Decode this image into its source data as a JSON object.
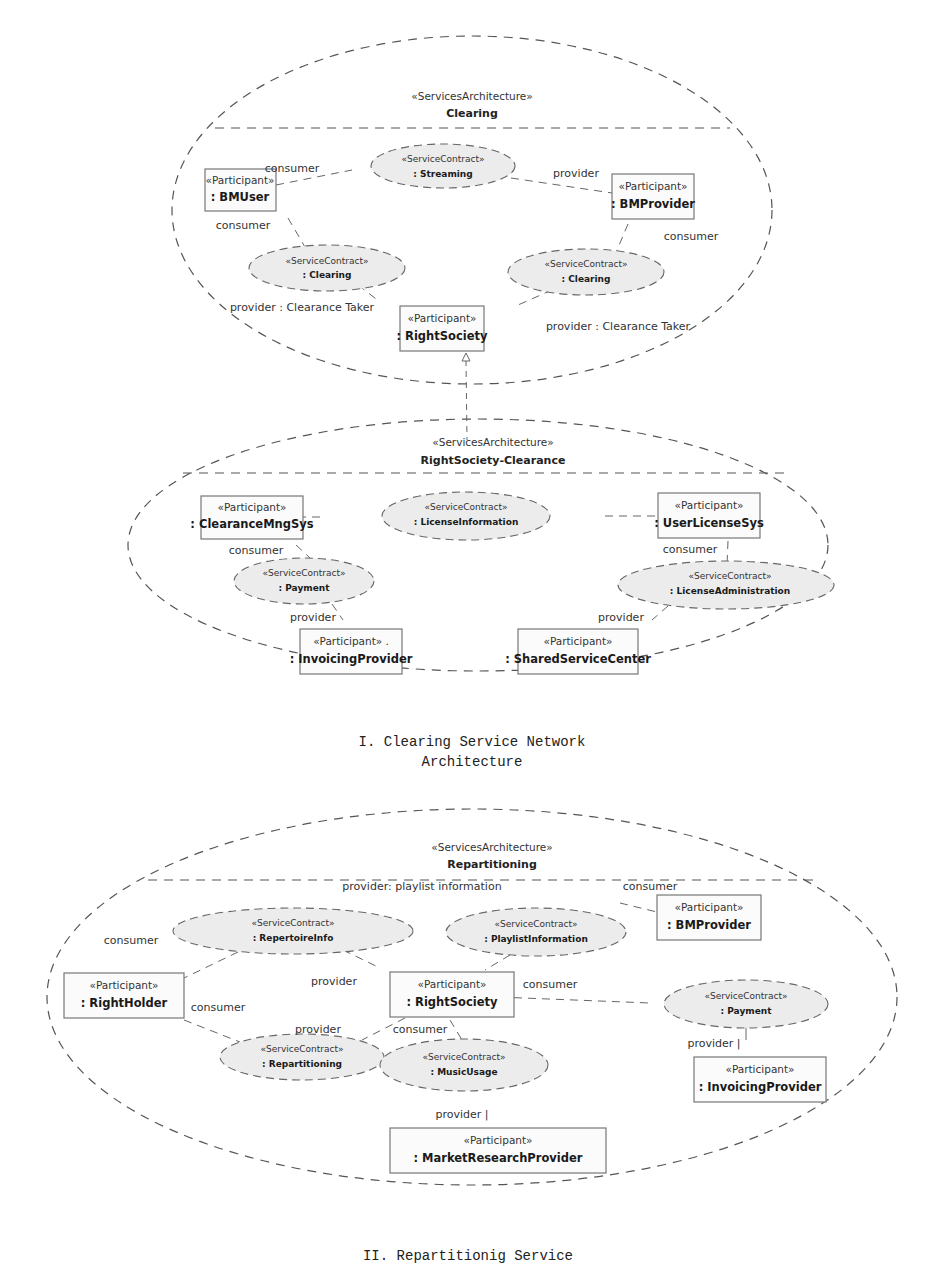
{
  "diagrams": [
    {
      "stereotype": "«ServicesArchitecture»",
      "name": "Clearing",
      "participants": [
        {
          "stereotype": "«Participant»",
          "name": ": BMUser"
        },
        {
          "stereotype": "«Participant»",
          "name": ": BMProvider"
        },
        {
          "stereotype": "«Participant»",
          "name": ": RightSociety"
        }
      ],
      "contracts": [
        {
          "stereotype": "«ServiceContract»",
          "name": ": Streaming"
        },
        {
          "stereotype": "«ServiceContract»",
          "name": ": Clearing"
        },
        {
          "stereotype": "«ServiceContract»",
          "name": ": Clearing"
        }
      ],
      "roles": [
        "consumer",
        "provider",
        "consumer",
        "consumer",
        "provider : Clearance Taker",
        "provider : Clearance Taker"
      ]
    },
    {
      "stereotype": "«ServicesArchitecture»",
      "name": "RightSociety-Clearance",
      "participants": [
        {
          "stereotype": "«Participant»",
          "name": ": ClearanceMngSys"
        },
        {
          "stereotype": "«Participant»",
          "name": ": UserLicenseSys"
        },
        {
          "stereotype": "«Participant» .",
          "name": ": InvoicingProvider"
        },
        {
          "stereotype": "«Participant»",
          "name": ": SharedServiceCenter"
        }
      ],
      "contracts": [
        {
          "stereotype": "«ServiceContract»",
          "name": ": LicenseInformation"
        },
        {
          "stereotype": "«ServiceContract»",
          "name": ": Payment"
        },
        {
          "stereotype": "«ServiceContract»",
          "name": ": LicenseAdministration"
        }
      ],
      "roles": [
        "consumer",
        "provider",
        "consumer",
        "provider"
      ]
    },
    {
      "stereotype": "«ServicesArchitecture»",
      "name": "Repartitioning",
      "participants": [
        {
          "stereotype": "«Participant»",
          "name": ": BMProvider"
        },
        {
          "stereotype": "«Participant»",
          "name": ": RightHolder"
        },
        {
          "stereotype": "«Participant»",
          "name": ": RightSociety"
        },
        {
          "stereotype": "«Participant»",
          "name": ": InvoicingProvider"
        },
        {
          "stereotype": "«Participant»",
          "name": ": MarketResearchProvider"
        }
      ],
      "contracts": [
        {
          "stereotype": "«ServiceContract»",
          "name": ": RepertoireInfo"
        },
        {
          "stereotype": "«ServiceContract»",
          "name": ": PlaylistInformation"
        },
        {
          "stereotype": "«ServiceContract»",
          "name": ": Payment"
        },
        {
          "stereotype": "«ServiceContract»",
          "name": ": Repartitioning"
        },
        {
          "stereotype": "«ServiceContract»",
          "name": ": MusicUsage"
        }
      ],
      "roles": [
        "provider: playlist information",
        "consumer",
        "consumer",
        "provider",
        "consumer",
        "consumer",
        "provider",
        "consumer",
        "provider |",
        "provider |"
      ]
    }
  ],
  "captions": {
    "first_line1": "I. Clearing Service Network",
    "first_line2": "Architecture",
    "second": "II. Repartitionig Service"
  }
}
